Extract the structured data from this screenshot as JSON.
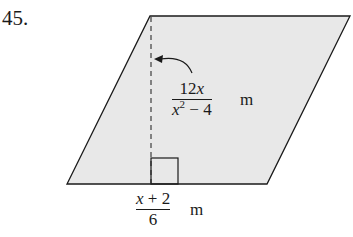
{
  "problem": {
    "number": "45.",
    "shape": "parallelogram",
    "fill_color": "#e8e8e8",
    "stroke_color": "#1a1a1a"
  },
  "height_label": {
    "numerator": "12x",
    "denominator_base": "x",
    "denominator_exp": "2",
    "denominator_rest": " − 4",
    "unit": "m"
  },
  "base_label": {
    "numerator": "x + 2",
    "denominator": "6",
    "unit": "m"
  }
}
